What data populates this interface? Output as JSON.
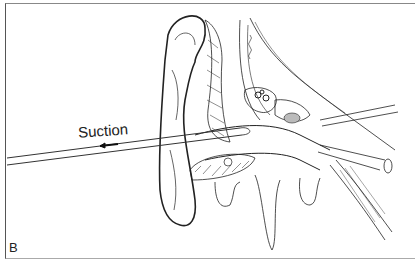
{
  "figure": {
    "panel_label": "B",
    "annotation": "Suction",
    "arrow_direction": "left",
    "colors": {
      "ink": "#222222",
      "background": "#ffffff"
    }
  }
}
